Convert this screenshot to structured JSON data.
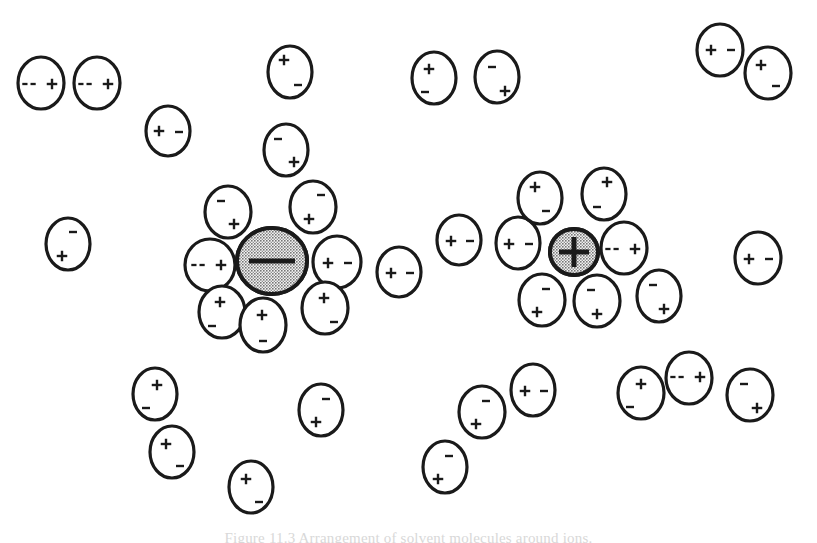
{
  "figure": {
    "caption": "Figure 11.3  Arrangement of solvent molecules around ions.",
    "background_color": "#ffffff",
    "ink_color": "#1a1a1a",
    "ion_fill_color": "#a9a9a9",
    "molecule_fill_color": "#ffffff",
    "plus_glyph": "+",
    "minus_glyph": "-",
    "double_minus_glyph": "--"
  },
  "ions": [
    {
      "id": "anion",
      "name": "negative-ion",
      "charge_label": "-",
      "charge_type": "negative",
      "cx": 272,
      "cy": 261,
      "rx": 35,
      "ry": 33,
      "stroke_width": 4,
      "bar_length": 46,
      "bar_thickness": 5
    },
    {
      "id": "cation",
      "name": "positive-ion",
      "charge_label": "+",
      "charge_type": "positive",
      "cx": 574,
      "cy": 252,
      "rx": 24,
      "ry": 23,
      "stroke_width": 4,
      "bar_length": 30,
      "bar_thickness": 5
    }
  ],
  "molecules": [
    {
      "id": "m01",
      "group": "free-top-left",
      "cx": 41,
      "cy": 83,
      "rx": 23,
      "ry": 26,
      "rot": 0,
      "pos_label": "+",
      "neg_label": "--",
      "pos_x": 11,
      "pos_y": 1,
      "neg_x": -12,
      "neg_y": 1,
      "neg_style": "double"
    },
    {
      "id": "m02",
      "group": "free-top-left",
      "cx": 97,
      "cy": 83,
      "rx": 23,
      "ry": 26,
      "rot": 0,
      "pos_label": "+",
      "neg_label": "--",
      "pos_x": 11,
      "pos_y": 1,
      "neg_x": -12,
      "neg_y": 1,
      "neg_style": "double"
    },
    {
      "id": "m03",
      "group": "free-top-left",
      "cx": 168,
      "cy": 131,
      "rx": 22,
      "ry": 25,
      "rot": 0,
      "pos_label": "+",
      "neg_label": "-",
      "pos_x": -9,
      "pos_y": 0,
      "neg_x": 11,
      "neg_y": 1,
      "neg_style": "single"
    },
    {
      "id": "m04",
      "group": "free-top",
      "cx": 290,
      "cy": 72,
      "rx": 22,
      "ry": 26,
      "rot": 0,
      "pos_label": "+",
      "neg_label": "-",
      "pos_x": -6,
      "pos_y": -12,
      "neg_x": 8,
      "neg_y": 13,
      "neg_style": "single"
    },
    {
      "id": "m05",
      "group": "free-top",
      "cx": 286,
      "cy": 150,
      "rx": 22,
      "ry": 26,
      "rot": 0,
      "pos_label": "+",
      "neg_label": "-",
      "pos_x": 8,
      "pos_y": 12,
      "neg_x": -8,
      "neg_y": -11,
      "neg_style": "single"
    },
    {
      "id": "m06",
      "group": "free-top",
      "cx": 434,
      "cy": 78,
      "rx": 22,
      "ry": 26,
      "rot": 0,
      "pos_label": "+",
      "neg_label": "-",
      "pos_x": -5,
      "pos_y": -9,
      "neg_x": -9,
      "neg_y": 14,
      "neg_style": "single"
    },
    {
      "id": "m07",
      "group": "free-top",
      "cx": 497,
      "cy": 77,
      "rx": 22,
      "ry": 26,
      "rot": 0,
      "pos_label": "+",
      "neg_label": "-",
      "pos_x": 8,
      "pos_y": 14,
      "neg_x": -5,
      "neg_y": -10,
      "neg_style": "single"
    },
    {
      "id": "m08",
      "group": "free-top-right",
      "cx": 720,
      "cy": 50,
      "rx": 23,
      "ry": 26,
      "rot": 0,
      "pos_label": "+",
      "neg_label": "-",
      "pos_x": -9,
      "pos_y": 0,
      "neg_x": 11,
      "neg_y": 0,
      "neg_style": "single"
    },
    {
      "id": "m09",
      "group": "free-top-right",
      "cx": 768,
      "cy": 73,
      "rx": 23,
      "ry": 26,
      "rot": 0,
      "pos_label": "+",
      "neg_label": "-",
      "pos_x": -7,
      "pos_y": -8,
      "neg_x": 8,
      "neg_y": 13,
      "neg_style": "single"
    },
    {
      "id": "m10",
      "group": "free-left",
      "cx": 68,
      "cy": 244,
      "rx": 22,
      "ry": 26,
      "rot": 0,
      "pos_label": "+",
      "neg_label": "-",
      "pos_x": -6,
      "pos_y": 12,
      "neg_x": 5,
      "neg_y": -12,
      "neg_style": "single"
    },
    {
      "id": "m11",
      "group": "shell-anion",
      "cx": 228,
      "cy": 212,
      "rx": 23,
      "ry": 26,
      "rot": 0,
      "pos_label": "+",
      "neg_label": "-",
      "pos_x": 6,
      "pos_y": 12,
      "neg_x": -7,
      "neg_y": -11,
      "neg_style": "single"
    },
    {
      "id": "m12",
      "group": "shell-anion",
      "cx": 313,
      "cy": 207,
      "rx": 23,
      "ry": 26,
      "rot": 0,
      "pos_label": "+",
      "neg_label": "-",
      "pos_x": -4,
      "pos_y": 12,
      "neg_x": 8,
      "neg_y": -12,
      "neg_style": "single"
    },
    {
      "id": "m13",
      "group": "shell-anion",
      "cx": 210,
      "cy": 265,
      "rx": 25,
      "ry": 26,
      "rot": 0,
      "pos_label": "+",
      "neg_label": "--",
      "pos_x": 11,
      "pos_y": 0,
      "neg_x": -12,
      "neg_y": 0,
      "neg_style": "double"
    },
    {
      "id": "m14",
      "group": "shell-anion",
      "cx": 337,
      "cy": 262,
      "rx": 24,
      "ry": 26,
      "rot": 0,
      "pos_label": "+",
      "neg_label": "-",
      "pos_x": -9,
      "pos_y": 1,
      "neg_x": 11,
      "neg_y": 1,
      "neg_style": "single"
    },
    {
      "id": "m15",
      "group": "shell-anion",
      "cx": 222,
      "cy": 312,
      "rx": 23,
      "ry": 26,
      "rot": 0,
      "pos_label": "+",
      "neg_label": "-",
      "pos_x": -2,
      "pos_y": -10,
      "neg_x": -10,
      "neg_y": 14,
      "neg_style": "single"
    },
    {
      "id": "m16",
      "group": "shell-anion",
      "cx": 263,
      "cy": 325,
      "rx": 23,
      "ry": 27,
      "rot": 0,
      "pos_label": "+",
      "neg_label": "-",
      "pos_x": -1,
      "pos_y": -10,
      "neg_x": 0,
      "neg_y": 16,
      "neg_style": "single"
    },
    {
      "id": "m17",
      "group": "shell-anion",
      "cx": 325,
      "cy": 308,
      "rx": 23,
      "ry": 26,
      "rot": 0,
      "pos_label": "+",
      "neg_label": "-",
      "pos_x": -1,
      "pos_y": -10,
      "neg_x": 9,
      "neg_y": 14,
      "neg_style": "single"
    },
    {
      "id": "m18",
      "group": "free-middle",
      "cx": 399,
      "cy": 272,
      "rx": 22,
      "ry": 25,
      "rot": 0,
      "pos_label": "+",
      "neg_label": "-",
      "pos_x": -8,
      "pos_y": 1,
      "neg_x": 11,
      "neg_y": 1,
      "neg_style": "single"
    },
    {
      "id": "m19",
      "group": "free-middle",
      "cx": 459,
      "cy": 240,
      "rx": 22,
      "ry": 25,
      "rot": 0,
      "pos_label": "+",
      "neg_label": "-",
      "pos_x": -8,
      "pos_y": 1,
      "neg_x": 11,
      "neg_y": 1,
      "neg_style": "single"
    },
    {
      "id": "m20",
      "group": "shell-cation",
      "cx": 518,
      "cy": 243,
      "rx": 22,
      "ry": 26,
      "rot": 0,
      "pos_label": "+",
      "neg_label": "-",
      "pos_x": -9,
      "pos_y": 1,
      "neg_x": 11,
      "neg_y": 1,
      "neg_style": "single"
    },
    {
      "id": "m21",
      "group": "shell-cation",
      "cx": 540,
      "cy": 198,
      "rx": 22,
      "ry": 26,
      "rot": 0,
      "pos_label": "+",
      "neg_label": "-",
      "pos_x": -5,
      "pos_y": -11,
      "neg_x": 6,
      "neg_y": 13,
      "neg_style": "single"
    },
    {
      "id": "m22",
      "group": "shell-cation",
      "cx": 604,
      "cy": 194,
      "rx": 22,
      "ry": 26,
      "rot": 0,
      "pos_label": "+",
      "neg_label": "-",
      "pos_x": 3,
      "pos_y": -12,
      "neg_x": -7,
      "neg_y": 13,
      "neg_style": "single"
    },
    {
      "id": "m23",
      "group": "shell-cation",
      "cx": 624,
      "cy": 248,
      "rx": 23,
      "ry": 26,
      "rot": 0,
      "pos_label": "+",
      "neg_label": "--",
      "pos_x": 11,
      "pos_y": 1,
      "neg_x": -12,
      "neg_y": 1,
      "neg_style": "double"
    },
    {
      "id": "m24",
      "group": "shell-cation",
      "cx": 542,
      "cy": 300,
      "rx": 23,
      "ry": 26,
      "rot": 0,
      "pos_label": "+",
      "neg_label": "-",
      "pos_x": -5,
      "pos_y": 12,
      "neg_x": 4,
      "neg_y": -11,
      "neg_style": "single"
    },
    {
      "id": "m25",
      "group": "shell-cation",
      "cx": 597,
      "cy": 301,
      "rx": 23,
      "ry": 26,
      "rot": 0,
      "pos_label": "+",
      "neg_label": "-",
      "pos_x": 0,
      "pos_y": 13,
      "neg_x": -6,
      "neg_y": -11,
      "neg_style": "single"
    },
    {
      "id": "m26",
      "group": "shell-cation",
      "cx": 659,
      "cy": 296,
      "rx": 22,
      "ry": 26,
      "rot": 0,
      "pos_label": "+",
      "neg_label": "-",
      "pos_x": 5,
      "pos_y": 13,
      "neg_x": -6,
      "neg_y": -11,
      "neg_style": "single"
    },
    {
      "id": "m27",
      "group": "free-right",
      "cx": 758,
      "cy": 258,
      "rx": 23,
      "ry": 26,
      "rot": 0,
      "pos_label": "+",
      "neg_label": "-",
      "pos_x": -9,
      "pos_y": 1,
      "neg_x": 11,
      "neg_y": 1,
      "neg_style": "single"
    },
    {
      "id": "m28",
      "group": "free-bottom",
      "cx": 155,
      "cy": 394,
      "rx": 22,
      "ry": 26,
      "rot": 0,
      "pos_label": "+",
      "neg_label": "-",
      "pos_x": 2,
      "pos_y": -9,
      "neg_x": -9,
      "neg_y": 14,
      "neg_style": "single"
    },
    {
      "id": "m29",
      "group": "free-bottom",
      "cx": 172,
      "cy": 452,
      "rx": 22,
      "ry": 26,
      "rot": 0,
      "pos_label": "+",
      "neg_label": "-",
      "pos_x": -6,
      "pos_y": -8,
      "neg_x": 8,
      "neg_y": 14,
      "neg_style": "single"
    },
    {
      "id": "m30",
      "group": "free-bottom",
      "cx": 251,
      "cy": 487,
      "rx": 22,
      "ry": 26,
      "rot": 0,
      "pos_label": "+",
      "neg_label": "-",
      "pos_x": -5,
      "pos_y": -8,
      "neg_x": 8,
      "neg_y": 15,
      "neg_style": "single"
    },
    {
      "id": "m31",
      "group": "free-bottom",
      "cx": 321,
      "cy": 410,
      "rx": 22,
      "ry": 26,
      "rot": 0,
      "pos_label": "+",
      "neg_label": "-",
      "pos_x": -5,
      "pos_y": 12,
      "neg_x": 5,
      "neg_y": -11,
      "neg_style": "single"
    },
    {
      "id": "m32",
      "group": "free-bottom",
      "cx": 445,
      "cy": 467,
      "rx": 22,
      "ry": 26,
      "rot": 0,
      "pos_label": "+",
      "neg_label": "-",
      "pos_x": -7,
      "pos_y": 12,
      "neg_x": 4,
      "neg_y": -11,
      "neg_style": "single"
    },
    {
      "id": "m33",
      "group": "free-bottom",
      "cx": 482,
      "cy": 412,
      "rx": 23,
      "ry": 26,
      "rot": 0,
      "pos_label": "+",
      "neg_label": "-",
      "pos_x": -6,
      "pos_y": 12,
      "neg_x": 4,
      "neg_y": -11,
      "neg_style": "single"
    },
    {
      "id": "m34",
      "group": "free-bottom",
      "cx": 533,
      "cy": 390,
      "rx": 22,
      "ry": 26,
      "rot": 0,
      "pos_label": "+",
      "neg_label": "-",
      "pos_x": -8,
      "pos_y": 1,
      "neg_x": 11,
      "neg_y": 1,
      "neg_style": "single"
    },
    {
      "id": "m35",
      "group": "free-bottom",
      "cx": 641,
      "cy": 393,
      "rx": 23,
      "ry": 26,
      "rot": 0,
      "pos_label": "+",
      "neg_label": "-",
      "pos_x": 0,
      "pos_y": -9,
      "neg_x": -11,
      "neg_y": 14,
      "neg_style": "single"
    },
    {
      "id": "m36",
      "group": "free-bottom",
      "cx": 689,
      "cy": 378,
      "rx": 23,
      "ry": 26,
      "rot": 0,
      "pos_label": "+",
      "neg_label": "--",
      "pos_x": 11,
      "pos_y": -1,
      "neg_x": -12,
      "neg_y": -1,
      "neg_style": "double"
    },
    {
      "id": "m37",
      "group": "free-bottom",
      "cx": 750,
      "cy": 395,
      "rx": 23,
      "ry": 26,
      "rot": 0,
      "pos_label": "+",
      "neg_label": "-",
      "pos_x": 7,
      "pos_y": 13,
      "neg_x": -6,
      "neg_y": -11,
      "neg_style": "single"
    }
  ]
}
